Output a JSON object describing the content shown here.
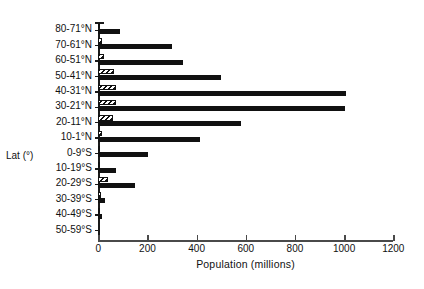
{
  "chart_data": {
    "type": "bar",
    "orientation": "horizontal",
    "title": "",
    "xlabel": "Population (millions)",
    "ylabel": "Lat (°)",
    "xlim": [
      0,
      1200
    ],
    "xticks": [
      0,
      200,
      400,
      600,
      800,
      1000,
      1200
    ],
    "xticklabels": [
      "0",
      "200",
      "400",
      "600",
      "800",
      "1000",
      "1200"
    ],
    "grid": false,
    "legend": "none",
    "categories": [
      "80-71°N",
      "70-61°N",
      "60-51°N",
      "50-41°N",
      "40-31°N",
      "30-21°N",
      "20-11°N",
      "10-1°N",
      "0-9°S",
      "10-19°S",
      "20-29°S",
      "30-39°S",
      "40-49°S",
      "50-59°S"
    ],
    "series": [
      {
        "name": "hatched",
        "fill": "hatched",
        "values": [
          2,
          14,
          22,
          62,
          74,
          70,
          60,
          14,
          6,
          8,
          40,
          12,
          4,
          0
        ]
      },
      {
        "name": "solid",
        "fill": "solid",
        "values": [
          90,
          300,
          346,
          500,
          1009,
          1005,
          580,
          414,
          203,
          72,
          150,
          26,
          14,
          0
        ]
      }
    ]
  },
  "axes": {
    "x_title": "Population (millions)",
    "y_title": "Lat (°)"
  }
}
